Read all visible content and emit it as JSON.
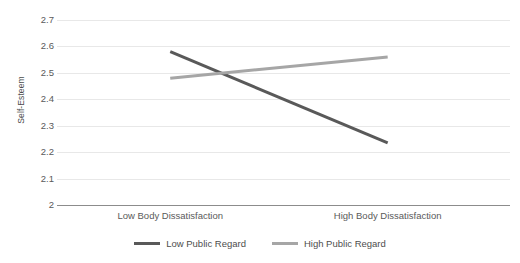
{
  "chart_data": {
    "type": "line",
    "title": "",
    "subtitle": "",
    "xlabel": "",
    "ylabel": "Self-Esteem",
    "categories": [
      "Low Body Dissatisfaction",
      "High Body Dissatisfaction"
    ],
    "ylim": [
      2,
      2.7
    ],
    "ytick_step": 0.1,
    "yticks": [
      "2.7",
      "2.6",
      "2.5",
      "2.4",
      "2.3",
      "2.2",
      "2.1",
      "2"
    ],
    "ytick_values": [
      2.7,
      2.6,
      2.5,
      2.4,
      2.3,
      2.2,
      2.1,
      2
    ],
    "grid": true,
    "grid_axis": "y",
    "legend_position": "bottom",
    "series": [
      {
        "name": "Low Public Regard",
        "values": [
          2.58,
          2.235
        ],
        "color": "#595959",
        "linewidth": 3
      },
      {
        "name": "High Public Regard",
        "values": [
          2.48,
          2.56
        ],
        "color": "#a6a6a6",
        "linewidth": 3
      }
    ],
    "colors": {
      "grid": "#e8e8e8",
      "axis": "#8c8c8c",
      "text": "#5a5a5a",
      "background": "#ffffff"
    }
  },
  "legend": {
    "items": [
      {
        "label": "Low Public Regard",
        "color": "#595959"
      },
      {
        "label": "High Public Regard",
        "color": "#a6a6a6"
      }
    ]
  }
}
